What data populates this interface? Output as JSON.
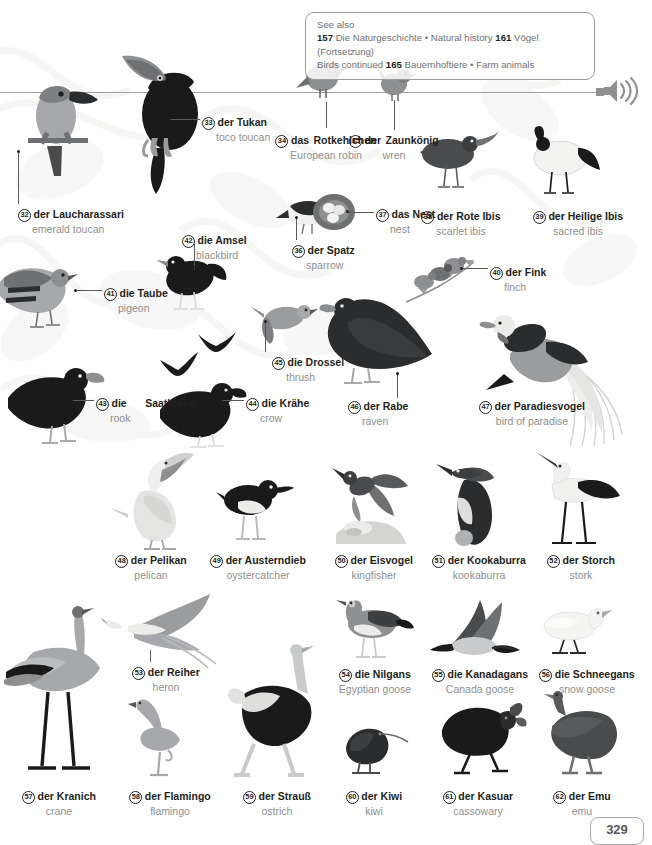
{
  "page": {
    "number": "329",
    "audio_icon": "speaker-icon",
    "background": "#ffffff",
    "ink": "#231f20",
    "secondary_text": "#8e8f90"
  },
  "see_also": {
    "title": "See also",
    "lines": [
      {
        "ref1": "157",
        "text1": "Die Naturgeschichte • Natural history",
        "ref2": "161",
        "text2": "Vögel (Fortsetzung)"
      },
      {
        "ref1": "",
        "text1": "Birds continued",
        "ref2": "165",
        "text2": "Bauernhoftiere • Farm animals"
      }
    ]
  },
  "entries": [
    {
      "num": "32",
      "de": "der Laucharassari",
      "en": "emerald toucan"
    },
    {
      "num": "33",
      "de": "der Tukan",
      "en": "toco toucan"
    },
    {
      "num": "34",
      "de": "das Rotkehlchen",
      "de_l1": "das",
      "de_l2": "Rotkehlchen",
      "en": "European robin"
    },
    {
      "num": "35",
      "de": "der Zaunkönig",
      "de_l1": "der",
      "de_l2": "Zaunkönig",
      "en": "wren"
    },
    {
      "num": "36",
      "de": "der Spatz",
      "en": "sparrow"
    },
    {
      "num": "37",
      "de": "das Nest",
      "en": "nest"
    },
    {
      "num": "38",
      "de": "der Rote Ibis",
      "en": "scarlet ibis"
    },
    {
      "num": "39",
      "de": "der Heilige Ibis",
      "en": "sacred ibis"
    },
    {
      "num": "40",
      "de": "der Fink",
      "en": "finch"
    },
    {
      "num": "41",
      "de": "die Taube",
      "en": "pigeon"
    },
    {
      "num": "42",
      "de": "die Amsel",
      "en": "blackbird"
    },
    {
      "num": "43",
      "de": "die Saatkrähe",
      "de_l1": "die",
      "de_l2": "Saatkrähe",
      "en": "rook"
    },
    {
      "num": "44",
      "de": "die Krähe",
      "en": "crow"
    },
    {
      "num": "45",
      "de": "die Drossel",
      "en": "thrush"
    },
    {
      "num": "46",
      "de": "der Rabe",
      "en": "raven"
    },
    {
      "num": "47",
      "de": "der Paradiesvogel",
      "en": "bird of paradise"
    },
    {
      "num": "48",
      "de": "der Pelikan",
      "en": "pelican"
    },
    {
      "num": "49",
      "de": "der Austerndieb",
      "en": "oystercatcher"
    },
    {
      "num": "50",
      "de": "der Eisvogel",
      "en": "kingfisher"
    },
    {
      "num": "51",
      "de": "der Kookaburra",
      "en": "kookaburra"
    },
    {
      "num": "52",
      "de": "der Storch",
      "en": "stork"
    },
    {
      "num": "53",
      "de": "der Reiher",
      "en": "heron"
    },
    {
      "num": "54",
      "de": "die Nilgans",
      "en": "Egyptian goose"
    },
    {
      "num": "55",
      "de": "die Kanadagans",
      "en": "Canada goose"
    },
    {
      "num": "56",
      "de": "die Schneegans",
      "en": "snow goose"
    },
    {
      "num": "57",
      "de": "der Kranich",
      "en": "crane"
    },
    {
      "num": "58",
      "de": "der Flamingo",
      "en": "flamingo"
    },
    {
      "num": "59",
      "de": "der Strauß",
      "en": "ostrich"
    },
    {
      "num": "60",
      "de": "der Kiwi",
      "en": "kiwi"
    },
    {
      "num": "61",
      "de": "der Kasuar",
      "en": "cassowary"
    },
    {
      "num": "62",
      "de": "der Emu",
      "en": "emu"
    }
  ]
}
